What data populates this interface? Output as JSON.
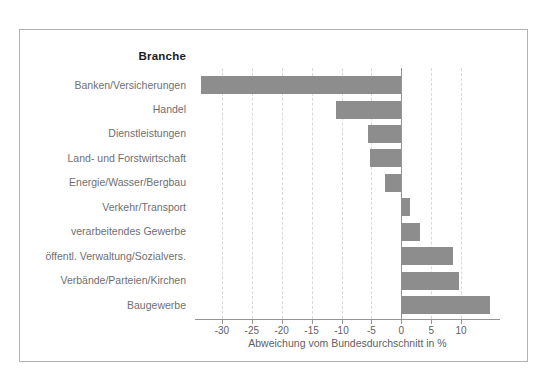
{
  "figure": {
    "column_header": "Branche"
  },
  "chart_data": {
    "type": "bar",
    "orientation": "horizontal",
    "title": "Branche",
    "xlabel": "Abweichung vom Bundesdurchschnitt in %",
    "categories": [
      "Banken/Versicherungen",
      "Handel",
      "Dienstleistungen",
      "Land- und Forstwirtschaft",
      "Energie/Wasser/Bergbau",
      "Verkehr/Transport",
      "verarbeitendes Gewerbe",
      "öffentl. Verwaltung/Sozialvers.",
      "Verbände/Parteien/Kirchen",
      "Baugewerbe"
    ],
    "values": [
      -33.5,
      -11.0,
      -5.5,
      -5.3,
      -2.8,
      1.4,
      3.2,
      8.7,
      9.7,
      14.9
    ],
    "xlim": [
      -34.5,
      16.5
    ],
    "xticks": [
      -30,
      -25,
      -20,
      -15,
      -10,
      -5,
      0,
      5,
      10
    ],
    "xtick_labels": [
      "-30",
      "-25",
      "-20",
      "-15",
      "-10",
      "-5",
      "0",
      "5",
      "10"
    ],
    "grid": "vertical-dashed",
    "legend": "none",
    "colors": {
      "bar": "#8d8d8d",
      "axis": "#949494",
      "gridline": "#d9d9d9",
      "frame_border": "#b2b2b2",
      "category_text": "#6f6f6f",
      "title_text": "#1c1c1c",
      "background": "#ffffff"
    }
  }
}
